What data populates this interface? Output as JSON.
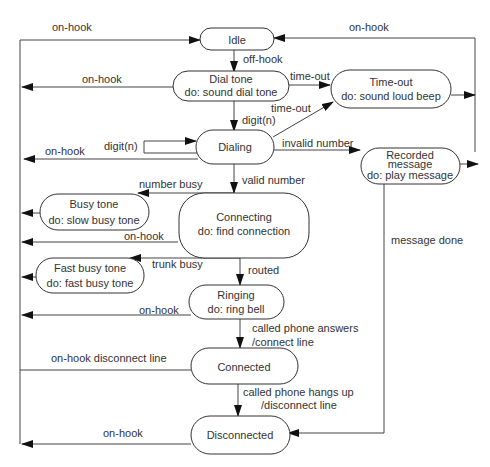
{
  "diagram": {
    "type": "state-machine",
    "states": {
      "idle": {
        "lines": [
          "Idle"
        ]
      },
      "dial_tone": {
        "lines": [
          "Dial tone",
          "do: sound dial tone"
        ]
      },
      "time_out": {
        "lines": [
          "Time-out",
          "do: sound loud beep"
        ]
      },
      "dialing": {
        "lines": [
          "Dialing"
        ]
      },
      "recorded_message": {
        "lines": [
          "Recorded",
          "message",
          "do: play message"
        ]
      },
      "busy_tone": {
        "lines": [
          "Busy tone",
          "do: slow busy tone"
        ]
      },
      "connecting": {
        "lines": [
          "Connecting",
          "do: find connection"
        ]
      },
      "fast_busy_tone": {
        "lines": [
          "Fast busy tone",
          "do: fast busy tone"
        ]
      },
      "ringing": {
        "lines": [
          "Ringing",
          "do: ring bell"
        ]
      },
      "connected": {
        "lines": [
          "Connected"
        ]
      },
      "disconnected": {
        "lines": [
          "Disconnected"
        ]
      }
    },
    "labels": {
      "onhook_left_idle": "on-hook",
      "onhook_right_idle": "on-hook",
      "off_hook": "off-hook",
      "onhook_dialtone": "on-hook",
      "timeout_dialtone": "time-out",
      "timeout_dialing": "time-out",
      "digit_first": "digit(n)",
      "digit_self": "digit(n)",
      "onhook_dialing": "on-hook",
      "invalid_number": "invalid number",
      "valid_number": "valid number",
      "number_busy": "number busy",
      "onhook_connecting": "on-hook",
      "trunk_busy": "trunk busy",
      "routed": "routed",
      "onhook_ringing": "on-hook",
      "called_answers_1": "called phone answers",
      "called_answers_2": "/connect line",
      "onhook_disconnect_line": "on-hook disconnect line",
      "hangs_up_1": "called phone hangs up",
      "hangs_up_2": "/disconnect line",
      "message_done": "message done",
      "onhook_disconnected": "on-hook"
    },
    "transitions": [
      {
        "from": "idle",
        "to": "dial_tone",
        "label": "off-hook"
      },
      {
        "from": "dial_tone",
        "to": "idle",
        "label": "on-hook"
      },
      {
        "from": "dial_tone",
        "to": "time_out",
        "label": "time-out"
      },
      {
        "from": "dial_tone",
        "to": "dialing",
        "label": "digit(n)"
      },
      {
        "from": "dialing",
        "to": "dialing",
        "label": "digit(n)"
      },
      {
        "from": "dialing",
        "to": "time_out",
        "label": "time-out"
      },
      {
        "from": "dialing",
        "to": "idle",
        "label": "on-hook"
      },
      {
        "from": "dialing",
        "to": "recorded_message",
        "label": "invalid number"
      },
      {
        "from": "dialing",
        "to": "connecting",
        "label": "valid number"
      },
      {
        "from": "connecting",
        "to": "busy_tone",
        "label": "number busy"
      },
      {
        "from": "connecting",
        "to": "fast_busy_tone",
        "label": "trunk busy"
      },
      {
        "from": "connecting",
        "to": "idle",
        "label": "on-hook"
      },
      {
        "from": "connecting",
        "to": "ringing",
        "label": "routed"
      },
      {
        "from": "ringing",
        "to": "idle",
        "label": "on-hook"
      },
      {
        "from": "ringing",
        "to": "connected",
        "label": "called phone answers /connect line"
      },
      {
        "from": "connected",
        "to": "idle",
        "label": "on-hook disconnect line"
      },
      {
        "from": "connected",
        "to": "disconnected",
        "label": "called phone hangs up /disconnect line"
      },
      {
        "from": "disconnected",
        "to": "idle",
        "label": "on-hook"
      },
      {
        "from": "time_out",
        "to": "idle",
        "label": "on-hook"
      },
      {
        "from": "recorded_message",
        "to": "idle",
        "label": "on-hook"
      },
      {
        "from": "recorded_message",
        "to": "disconnected",
        "label": "message done"
      },
      {
        "from": "busy_tone",
        "to": "idle",
        "label": "on-hook"
      },
      {
        "from": "fast_busy_tone",
        "to": "idle",
        "label": "on-hook"
      }
    ]
  }
}
